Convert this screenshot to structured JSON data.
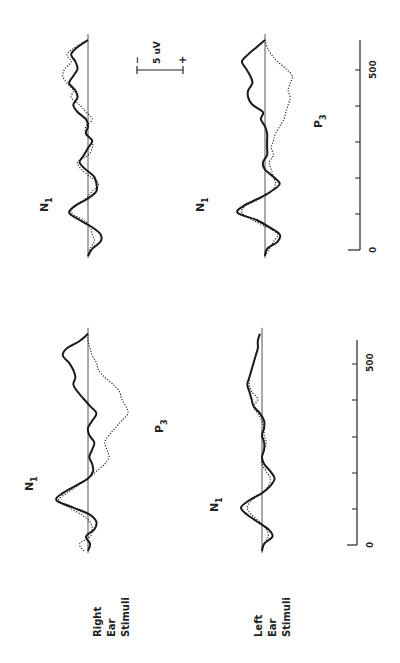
{
  "chart_data": {
    "type": "line",
    "title": "",
    "orientation_note": "figure printed rotated 90 degrees counter-clockwise",
    "xlabel": "Time (ms)",
    "ylabel": "Amplitude (uV, negative up)",
    "xlim": [
      0,
      600
    ],
    "x_ticks": [
      0,
      100,
      200,
      300,
      400,
      500
    ],
    "x_tick_labels": [
      "0",
      "",
      "",
      "",
      "",
      "500"
    ],
    "scale_bar": {
      "label": "5 uV",
      "neg": "-",
      "pos": "+"
    },
    "legend": [
      {
        "name": "Solid",
        "style": "solid"
      },
      {
        "name": "Dotted",
        "style": "dotted"
      }
    ],
    "rows": [
      {
        "label_lines": [
          "Right",
          "Ear",
          "Stimuli"
        ]
      },
      {
        "label_lines": [
          "Left",
          "Ear",
          "Stimuli"
        ]
      }
    ],
    "panels": [
      {
        "id": "right-ear-col1",
        "row": "Right Ear Stimuli",
        "column": 1,
        "annotations": [
          "N1",
          "P3"
        ],
        "x": [
          0,
          20,
          40,
          60,
          80,
          100,
          120,
          140,
          160,
          180,
          200,
          220,
          240,
          260,
          280,
          300,
          320,
          340,
          360,
          380,
          400,
          420,
          440,
          460,
          480,
          500,
          520,
          540,
          560,
          580,
          600
        ],
        "series": [
          {
            "name": "Solid",
            "values": [
              0,
              0.5,
              -0.5,
              1.5,
              2.0,
              0.5,
              -3.5,
              -7.5,
              -6.0,
              -3.0,
              0,
              1.2,
              1.0,
              0.3,
              1.0,
              1.5,
              0.3,
              0,
              1.0,
              2.0,
              0.5,
              -1.0,
              -2.5,
              -3.5,
              -3.0,
              -3.5,
              -4.5,
              -6.0,
              -5.0,
              -2.0,
              0
            ]
          },
          {
            "name": "Dotted",
            "values": [
              -1.0,
              -2.0,
              0.5,
              1.0,
              0.5,
              -1.5,
              -4.5,
              -7.0,
              -5.0,
              -2.5,
              0,
              2.0,
              4.0,
              5.0,
              4.5,
              4.0,
              5.0,
              6.5,
              8.0,
              9.5,
              9.0,
              8.0,
              7.5,
              6.0,
              4.0,
              2.5,
              2.0,
              1.0,
              0.5,
              0,
              0
            ]
          }
        ]
      },
      {
        "id": "left-ear-col1",
        "row": "Left Ear Stimuli",
        "column": 1,
        "annotations": [
          "N1"
        ],
        "x": [
          0,
          20,
          40,
          60,
          80,
          100,
          120,
          140,
          160,
          180,
          200,
          220,
          240,
          260,
          280,
          300,
          320,
          340,
          360,
          380,
          400,
          420,
          440,
          460,
          480,
          500,
          520,
          540,
          560,
          580,
          600
        ],
        "series": [
          {
            "name": "Solid",
            "values": [
              0,
              0.5,
              2.5,
              1.5,
              -1.0,
              -3.5,
              -5.0,
              -3.0,
              0,
              2.0,
              3.0,
              2.0,
              0.5,
              0,
              0.5,
              0.5,
              0,
              0.5,
              0.5,
              -0.5,
              -2.0,
              -2.5,
              -3.0,
              -3.5,
              -3.0,
              -2.5,
              -2.0,
              -1.5,
              -1.0,
              -1.0,
              -0.5
            ]
          },
          {
            "name": "Dotted",
            "values": [
              0,
              0.5,
              1.5,
              1.0,
              -0.5,
              -2.5,
              -3.5,
              -2.5,
              0,
              1.5,
              2.0,
              1.0,
              0,
              0,
              0.5,
              1.0,
              0.5,
              0.5,
              0,
              -1.0,
              -2.0,
              -1.0,
              -2.5,
              -3.0,
              -3.0,
              -2.5,
              -2.0,
              -1.5,
              -1.0,
              -1.0,
              -0.5
            ]
          }
        ]
      },
      {
        "id": "right-ear-col2",
        "row": "Right Ear Stimuli",
        "column": 2,
        "annotations": [
          "N1"
        ],
        "x": [
          0,
          20,
          40,
          60,
          80,
          100,
          120,
          140,
          160,
          180,
          200,
          220,
          240,
          260,
          280,
          300,
          320,
          340,
          360,
          380,
          400,
          420,
          440,
          460,
          480,
          500,
          520,
          540,
          560,
          580,
          600
        ],
        "series": [
          {
            "name": "Solid",
            "values": [
              0,
              1.0,
              3.0,
              3.0,
              1.0,
              -2.0,
              -4.5,
              -3.0,
              0,
              2.0,
              2.0,
              1.5,
              -0.5,
              -2.0,
              -1.0,
              0,
              1.0,
              -0.5,
              0,
              -0.5,
              -2.5,
              -3.5,
              -2.5,
              -3.0,
              -4.5,
              -3.5,
              -2.5,
              -3.0,
              -4.0,
              -2.5,
              0
            ]
          },
          {
            "name": "Dotted",
            "values": [
              0,
              0.5,
              1.5,
              1.0,
              0.5,
              -1.0,
              -4.0,
              -3.0,
              -0.5,
              1.0,
              2.5,
              0.5,
              -1.5,
              -2.5,
              0,
              1.0,
              1.0,
              -0.5,
              -0.5,
              1.0,
              -0.5,
              -2.0,
              -4.0,
              -3.5,
              -5.0,
              -6.0,
              -5.5,
              -4.0,
              -5.0,
              -3.0,
              0
            ]
          }
        ]
      },
      {
        "id": "left-ear-col2",
        "row": "Left Ear Stimuli",
        "column": 2,
        "annotations": [
          "N1",
          "P3"
        ],
        "x": [
          0,
          20,
          40,
          60,
          80,
          100,
          120,
          140,
          160,
          180,
          200,
          220,
          240,
          260,
          280,
          300,
          320,
          340,
          360,
          380,
          400,
          420,
          440,
          460,
          480,
          500,
          520,
          540,
          560,
          580,
          600
        ],
        "series": [
          {
            "name": "Solid",
            "values": [
              0,
              0.5,
              3.0,
              3.5,
              1.0,
              -2.0,
              -6.5,
              -5.0,
              -1.5,
              1.5,
              3.5,
              2.0,
              0,
              -0.5,
              0.5,
              0.5,
              0.5,
              0.5,
              0,
              -1.0,
              -0.5,
              -3.0,
              -4.0,
              -4.0,
              -3.0,
              -3.5,
              -4.5,
              -5.5,
              -4.0,
              -2.0,
              0
            ]
          },
          {
            "name": "Dotted",
            "values": [
              0,
              1.0,
              2.0,
              3.0,
              0.5,
              -3.0,
              -5.5,
              -4.5,
              -1.0,
              1.5,
              2.5,
              2.0,
              1.5,
              1.0,
              2.0,
              1.5,
              2.0,
              2.5,
              3.5,
              4.5,
              5.0,
              5.5,
              6.0,
              5.5,
              6.0,
              6.5,
              5.0,
              3.0,
              1.5,
              0.5,
              0
            ]
          }
        ]
      }
    ]
  },
  "labels": {
    "row1": [
      "Right",
      "Ear",
      "Stimuli"
    ],
    "row2": [
      "Left",
      "Ear",
      "Stimuli"
    ],
    "n1": "N",
    "n1_sub": "1",
    "p3": "P",
    "p3_sub": "3",
    "scale": "5 uV",
    "scale_neg": "−",
    "scale_pos": "+",
    "tick0": "0",
    "tick500": "500"
  }
}
